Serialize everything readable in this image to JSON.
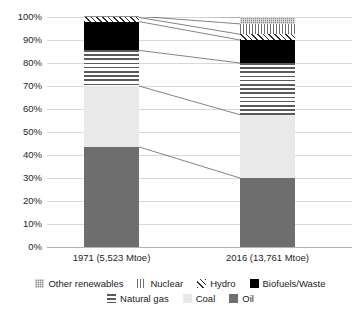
{
  "chart_data": {
    "type": "bar",
    "subtype": "100% stacked bar",
    "title": "",
    "xlabel": "",
    "ylabel": "",
    "ylim": [
      0,
      100
    ],
    "y_unit": "%",
    "grid": true,
    "legend_position": "bottom",
    "categories": [
      "1971 (5,523 Mtoe)",
      "2016 (13,761 Mtoe)"
    ],
    "ytick_labels": [
      "0%",
      "10%",
      "20%",
      "30%",
      "40%",
      "50%",
      "60%",
      "70%",
      "80%",
      "90%",
      "100%"
    ],
    "ytick_values": [
      0,
      10,
      20,
      30,
      40,
      50,
      60,
      70,
      80,
      90,
      100
    ],
    "series": [
      {
        "name": "Oil",
        "values": [
          43.5,
          30.0
        ],
        "pattern": "solid-dark-gray",
        "color": "#6e6e6e"
      },
      {
        "name": "Coal",
        "values": [
          26.5,
          27.5
        ],
        "pattern": "solid-light-gray",
        "color": "#e9e9e9"
      },
      {
        "name": "Natural gas",
        "values": [
          15.5,
          22.5
        ],
        "pattern": "horizontal-lines",
        "color": "#5a5a5a"
      },
      {
        "name": "Biofuels/Waste",
        "values": [
          12.5,
          10.0
        ],
        "pattern": "solid-black",
        "color": "#000000"
      },
      {
        "name": "Hydro",
        "values": [
          1.8,
          2.5
        ],
        "pattern": "diagonal-hatch",
        "color": "#2b2b2b"
      },
      {
        "name": "Nuclear",
        "values": [
          0.5,
          4.5
        ],
        "pattern": "vertical-lines",
        "color": "#6e6e6e"
      },
      {
        "name": "Other renewables",
        "values": [
          0.2,
          3.0
        ],
        "pattern": "fine-grid-dots",
        "color": "#8c8c8c"
      }
    ],
    "stack_order_bottom_to_top": [
      "Oil",
      "Coal",
      "Natural gas",
      "Biofuels/Waste",
      "Hydro",
      "Nuclear",
      "Other renewables"
    ]
  },
  "legend": {
    "rows": [
      [
        {
          "label": "Other renewables",
          "pattern": "fine-grid-dots"
        },
        {
          "label": "Nuclear",
          "pattern": "vertical-lines"
        },
        {
          "label": "Hydro",
          "pattern": "diagonal-hatch"
        },
        {
          "label": "Biofuels/Waste",
          "pattern": "solid-black"
        }
      ],
      [
        {
          "label": "Natural gas",
          "pattern": "horizontal-lines"
        },
        {
          "label": "Coal",
          "pattern": "solid-light-gray"
        },
        {
          "label": "Oil",
          "pattern": "solid-dark-gray"
        }
      ]
    ]
  },
  "colors": {
    "grid": "#d9d9d9",
    "axis": "#b3b3b3",
    "text": "#1a1a1a",
    "connector": "#4d4d4d",
    "background": "#ffffff"
  }
}
